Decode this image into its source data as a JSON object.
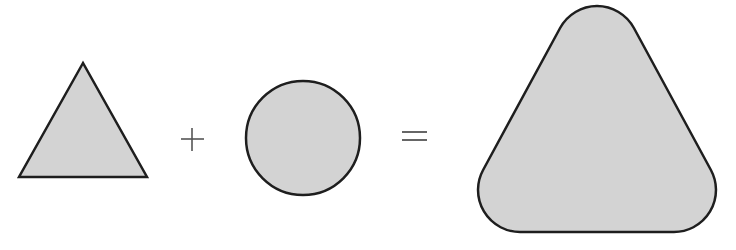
{
  "diagram": {
    "operators": {
      "plus": "+",
      "equals": "="
    },
    "colors": {
      "fill": "#d3d3d3",
      "stroke": "#1e1e1e",
      "operator": "#555555",
      "background": "#ffffff"
    },
    "shapes": [
      {
        "name": "triangle",
        "role": "operand-1"
      },
      {
        "name": "circle",
        "role": "operand-2"
      },
      {
        "name": "rounded-triangle",
        "role": "result"
      }
    ]
  }
}
